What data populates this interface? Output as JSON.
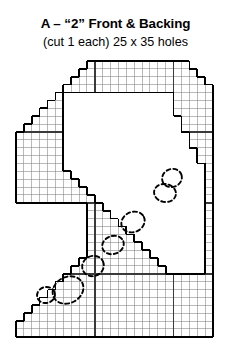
{
  "document": {
    "title": "A – “2” Front & Backing",
    "subtitle": "(cut 1 each) 25 x 35 holes"
  },
  "colors": {
    "ink": "#000000",
    "grid_minor": "#808080",
    "grid_major": "#3a3a3a",
    "outline": "#000000",
    "annotation": "#000000",
    "background": "#ffffff"
  },
  "pattern": {
    "name": "numeral-two-plastic-canvas-pattern",
    "shape_label": "2",
    "columns": 25,
    "rows": 35,
    "cell_px": 7.88,
    "origin_x": 16,
    "origin_y": 61,
    "minor_line_width": 0.55,
    "major_line_width": 1.5,
    "outline_width": 1.7,
    "major_columns": [
      10,
      20
    ],
    "major_rows": [
      9,
      18,
      27
    ],
    "row_spans": [
      [
        9,
        22
      ],
      [
        8,
        23
      ],
      [
        7,
        24
      ],
      [
        6,
        25
      ],
      [
        5,
        25
      ],
      [
        4,
        25
      ],
      [
        3,
        25
      ],
      [
        2,
        25
      ],
      [
        1,
        25
      ],
      [
        0,
        25
      ],
      [
        0,
        25
      ],
      [
        0,
        25
      ],
      [
        0,
        25
      ],
      [
        0,
        25
      ],
      [
        0,
        25
      ],
      [
        0,
        25
      ],
      [
        0,
        25
      ],
      [
        0,
        25
      ],
      [
        9,
        25
      ],
      [
        9,
        25
      ],
      [
        9,
        25
      ],
      [
        9,
        25
      ],
      [
        9,
        25
      ],
      [
        9,
        25
      ],
      [
        9,
        25
      ],
      [
        8,
        25
      ],
      [
        7,
        25
      ],
      [
        6,
        25
      ],
      [
        5,
        25
      ],
      [
        4,
        25
      ],
      [
        3,
        25
      ],
      [
        2,
        25
      ],
      [
        1,
        25
      ],
      [
        0,
        25
      ],
      [
        0,
        25
      ]
    ],
    "inner_notch": {
      "description": "hollow counter of the numeral 2",
      "row_spans": [
        [
          6,
          20
        ],
        [
          6,
          20
        ],
        [
          6,
          20
        ],
        [
          6,
          21
        ],
        [
          6,
          21
        ],
        [
          6,
          22
        ],
        [
          6,
          22
        ],
        [
          6,
          23
        ],
        [
          6,
          23
        ],
        [
          6,
          24
        ],
        [
          7,
          24
        ],
        [
          8,
          24
        ],
        [
          9,
          24
        ],
        [
          10,
          24
        ],
        [
          11,
          24
        ],
        [
          12,
          24
        ],
        [
          13,
          24
        ],
        [
          14,
          24
        ],
        [
          15,
          24
        ],
        [
          16,
          24
        ],
        [
          17,
          24
        ],
        [
          18,
          24
        ],
        [
          19,
          24
        ]
      ],
      "start_row": 4
    },
    "top_right_steps": [
      [
        22,
        0
      ],
      [
        23,
        1
      ],
      [
        24,
        2
      ],
      [
        25,
        3
      ]
    ],
    "bottom_rows_full": {
      "start_row": 26,
      "end_row": 34
    }
  },
  "annotations": {
    "type": "hand-drawn-dashed-marks",
    "count": 7,
    "items": [
      {
        "name": "mark-upper-right-cluster",
        "cx": 172,
        "cy": 178,
        "rx": 10,
        "ry": 9,
        "rot": -20
      },
      {
        "name": "mark-upper-right-lower",
        "cx": 165,
        "cy": 193,
        "rx": 11,
        "ry": 9,
        "rot": 10
      },
      {
        "name": "mark-diagonal-1",
        "cx": 133,
        "cy": 222,
        "rx": 12,
        "ry": 10,
        "rot": -25
      },
      {
        "name": "mark-diagonal-2",
        "cx": 113,
        "cy": 245,
        "rx": 11,
        "ry": 9,
        "rot": -20
      },
      {
        "name": "mark-diagonal-3",
        "cx": 93,
        "cy": 266,
        "rx": 11,
        "ry": 10,
        "rot": -25
      },
      {
        "name": "mark-lower-left-large",
        "cx": 68,
        "cy": 290,
        "rx": 16,
        "ry": 13,
        "rot": -28
      },
      {
        "name": "mark-lower-left-small",
        "cx": 46,
        "cy": 295,
        "rx": 9,
        "ry": 8,
        "rot": -15
      }
    ]
  }
}
